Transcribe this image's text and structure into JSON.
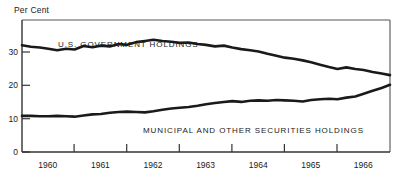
{
  "axes": {
    "unit_label": "Per Cent",
    "y_ticks": [
      "0",
      "10",
      "20",
      "30"
    ],
    "x_ticks": [
      "1960",
      "1961",
      "1962",
      "1963",
      "1964",
      "1965",
      "1966"
    ]
  },
  "annotations": {
    "upper_series_label": "U.S. GOVERNMENT HOLDINGS",
    "lower_series_label": "MUNICIPAL AND OTHER SECURITIES HOLDINGS"
  },
  "chart_data": {
    "type": "line",
    "title": "",
    "subtitle": "",
    "xlabel": "",
    "ylabel": "Per Cent",
    "xlim": [
      1959.58,
      1966.58
    ],
    "ylim": [
      0,
      34
    ],
    "grid": false,
    "legend_position": "inline-annotation",
    "axis_tick_labels_x": [
      "1960",
      "1961",
      "1962",
      "1963",
      "1964",
      "1965",
      "1966"
    ],
    "axis_tick_labels_y": [
      "0",
      "10",
      "20",
      "30"
    ],
    "line_color": "#1a1a1a",
    "line_width_px": 2.6,
    "series": [
      {
        "name": "U.S. GOVERNMENT HOLDINGS",
        "x": [
          1959.58,
          1959.75,
          1959.92,
          1960.08,
          1960.25,
          1960.42,
          1960.58,
          1960.75,
          1960.92,
          1961.08,
          1961.25,
          1961.42,
          1961.58,
          1961.75,
          1961.92,
          1962.08,
          1962.25,
          1962.42,
          1962.58,
          1962.75,
          1962.92,
          1963.08,
          1963.25,
          1963.42,
          1963.58,
          1963.75,
          1963.92,
          1964.08,
          1964.25,
          1964.42,
          1964.58,
          1964.75,
          1964.92,
          1965.08,
          1965.25,
          1965.42,
          1965.58,
          1965.75,
          1965.92,
          1966.08,
          1966.25,
          1966.42,
          1966.58
        ],
        "values": [
          27.5,
          27.1,
          26.9,
          26.6,
          26.2,
          26.6,
          26.4,
          27.3,
          27.0,
          27.4,
          27.2,
          27.8,
          27.6,
          28.3,
          28.6,
          28.9,
          28.6,
          28.4,
          28.1,
          28.2,
          27.8,
          27.6,
          27.2,
          27.4,
          26.9,
          26.5,
          26.2,
          25.9,
          25.3,
          24.8,
          24.3,
          24.0,
          23.6,
          23.1,
          22.5,
          21.9,
          21.4,
          21.8,
          21.4,
          21.1,
          20.6,
          20.2,
          19.8
        ]
      },
      {
        "name": "MUNICIPAL AND OTHER SECURITIES HOLDINGS",
        "x": [
          1959.58,
          1959.75,
          1959.92,
          1960.08,
          1960.25,
          1960.42,
          1960.58,
          1960.75,
          1960.92,
          1961.08,
          1961.25,
          1961.42,
          1961.58,
          1961.75,
          1961.92,
          1962.08,
          1962.25,
          1962.42,
          1962.58,
          1962.75,
          1962.92,
          1963.08,
          1963.25,
          1963.42,
          1963.58,
          1963.75,
          1963.92,
          1964.08,
          1964.25,
          1964.42,
          1964.58,
          1964.75,
          1964.92,
          1965.08,
          1965.25,
          1965.42,
          1965.58,
          1965.75,
          1965.92,
          1966.08,
          1966.25,
          1966.42,
          1966.58
        ],
        "values": [
          9.3,
          9.3,
          9.2,
          9.2,
          9.3,
          9.2,
          9.1,
          9.4,
          9.7,
          9.8,
          10.1,
          10.3,
          10.4,
          10.3,
          10.2,
          10.5,
          10.9,
          11.2,
          11.4,
          11.6,
          11.9,
          12.3,
          12.6,
          12.9,
          13.1,
          12.9,
          13.2,
          13.3,
          13.2,
          13.4,
          13.3,
          13.2,
          13.0,
          13.4,
          13.6,
          13.7,
          13.6,
          14.0,
          14.3,
          15.0,
          15.8,
          16.5,
          17.3
        ]
      }
    ],
    "annotations": [
      {
        "text": "U.S. GOVERNMENT HOLDINGS",
        "x": 1960.45,
        "y": 31.6
      },
      {
        "text": "MUNICIPAL AND OTHER SECURITIES HOLDINGS",
        "x": 1963.2,
        "y": 7.2
      }
    ]
  }
}
